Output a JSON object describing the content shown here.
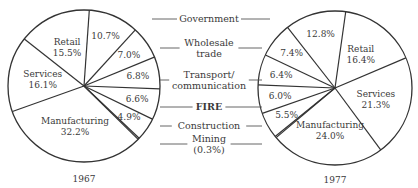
{
  "chart_data": {
    "type": "pie",
    "title": "",
    "charts": [
      {
        "label": "1967",
        "slices": [
          {
            "category": "Government",
            "value": 10.7,
            "label": "10.7%"
          },
          {
            "category": "Wholesale trade",
            "value": 7.0,
            "label": "7.0%"
          },
          {
            "category": "Transport/communication",
            "value": 6.8,
            "label": "6.8%"
          },
          {
            "category": "FIRE",
            "value": 6.6,
            "label": "6.6%"
          },
          {
            "category": "Construction",
            "value": 4.9,
            "label": "4.9%"
          },
          {
            "category": "Mining",
            "value": 0.3,
            "label": ""
          },
          {
            "category": "Manufacturing",
            "value": 32.2,
            "label": "Manufacturing|32.2%"
          },
          {
            "category": "Services",
            "value": 16.1,
            "label": "Services|16.1%"
          },
          {
            "category": "Retail",
            "value": 15.5,
            "label": "Retail|15.5%"
          }
        ]
      },
      {
        "label": "1977",
        "slices": [
          {
            "category": "Retail",
            "value": 16.4,
            "label": "Retail|16.4%"
          },
          {
            "category": "Services",
            "value": 21.3,
            "label": "Services|21.3%"
          },
          {
            "category": "Manufacturing",
            "value": 24.0,
            "label": "Manufacturing|24.0%"
          },
          {
            "category": "Mining",
            "value": 0.3,
            "label": ""
          },
          {
            "category": "Construction",
            "value": 5.5,
            "label": "5.5%"
          },
          {
            "category": "FIRE",
            "value": 6.0,
            "label": "6.0%"
          },
          {
            "category": "Transport/communication",
            "value": 6.4,
            "label": "6.4%"
          },
          {
            "category": "Wholesale trade",
            "value": 7.4,
            "label": "7.4%"
          },
          {
            "category": "Government",
            "value": 12.8,
            "label": "12.8%"
          }
        ]
      }
    ],
    "legend": [
      {
        "text": "Government",
        "y": 19
      },
      {
        "text": "Wholesale|trade",
        "y": 48
      },
      {
        "text": "Transport/|communication",
        "y": 80
      },
      {
        "text": "FIRE",
        "y": 107,
        "bold": true
      },
      {
        "text": "Construction",
        "y": 126
      },
      {
        "text": "Mining|(0.3%)",
        "y": 144
      }
    ]
  },
  "captions": {
    "left_year": "1967",
    "right_year": "1977"
  }
}
